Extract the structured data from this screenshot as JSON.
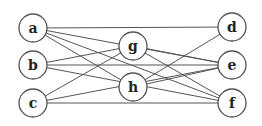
{
  "diagram": {
    "type": "graph",
    "nodes": [
      {
        "id": "a",
        "label": "a",
        "x": 33,
        "y": 28
      },
      {
        "id": "b",
        "label": "b",
        "x": 33,
        "y": 65
      },
      {
        "id": "c",
        "label": "c",
        "x": 33,
        "y": 103
      },
      {
        "id": "g",
        "label": "g",
        "x": 133,
        "y": 46
      },
      {
        "id": "h",
        "label": "h",
        "x": 133,
        "y": 87
      },
      {
        "id": "d",
        "label": "d",
        "x": 232,
        "y": 27
      },
      {
        "id": "e",
        "label": "e",
        "x": 232,
        "y": 65
      },
      {
        "id": "f",
        "label": "f",
        "x": 232,
        "y": 103
      }
    ],
    "edges": [
      [
        "a",
        "d"
      ],
      [
        "a",
        "e"
      ],
      [
        "a",
        "h"
      ],
      [
        "a",
        "f"
      ],
      [
        "b",
        "g"
      ],
      [
        "b",
        "e"
      ],
      [
        "b",
        "f"
      ],
      [
        "c",
        "g"
      ],
      [
        "c",
        "e"
      ],
      [
        "c",
        "f"
      ],
      [
        "g",
        "e"
      ],
      [
        "g",
        "f"
      ],
      [
        "h",
        "d"
      ],
      [
        "h",
        "e"
      ]
    ],
    "colors": {
      "stroke": "#555555",
      "node_fill": "#ffffff",
      "label": "#222222"
    }
  }
}
